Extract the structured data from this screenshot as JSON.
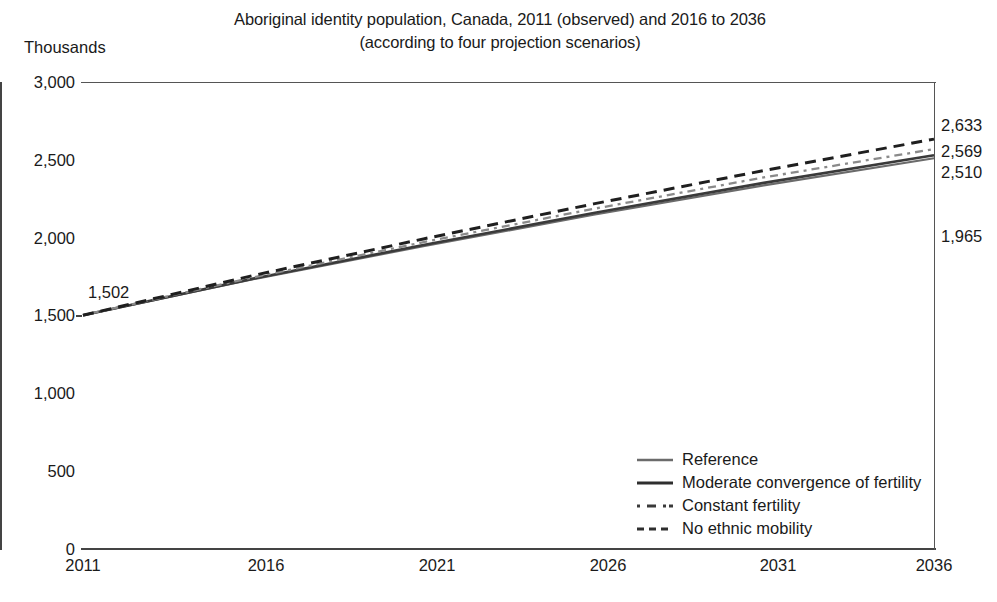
{
  "chart_data": {
    "type": "line",
    "title": "Aboriginal identity population, Canada, 2011 (observed) and 2016 to 2036",
    "subtitle": "(according to four projection scenarios)",
    "ylabel": "Thousands",
    "xlabel": "",
    "grid": false,
    "legend_position": "inside-bottom-right",
    "ylim": [
      0,
      3000
    ],
    "xlim": [
      2011,
      2036
    ],
    "yticks": [
      "0",
      "500",
      "1,000",
      "1,500",
      "2,000",
      "2,500",
      "3,000"
    ],
    "ytick_values": [
      0,
      500,
      1000,
      1500,
      2000,
      2500,
      3000
    ],
    "xticks": [
      "2011",
      "2016",
      "2021",
      "2026",
      "2031",
      "2036"
    ],
    "xtick_values": [
      2011,
      2016,
      2021,
      2026,
      2031,
      2036
    ],
    "x": [
      2011,
      2016,
      2021,
      2026,
      2031,
      2036
    ],
    "series": [
      {
        "name": "Reference",
        "style": "solid",
        "color": "#6b6b6b",
        "width": 2.1,
        "values": [
          1502,
          1733,
          1945,
          2147,
          2336,
          2510
        ]
      },
      {
        "name": "Moderate convergence of fertility",
        "style": "solid",
        "color": "#3a3a3a",
        "width": 2.6,
        "values": [
          1502,
          1737,
          1953,
          2158,
          2352,
          2530
        ]
      },
      {
        "name": "Constant fertility",
        "style": "dotted",
        "color": "#8a8a8a",
        "width": 2.3,
        "values": [
          1502,
          1745,
          1971,
          2185,
          2387,
          2569
        ]
      },
      {
        "name": "No ethnic mobility",
        "style": "dashed",
        "color": "#1f1f1f",
        "width": 3.0,
        "values": [
          1502,
          1757,
          1992,
          2217,
          2431,
          2633
        ]
      }
    ],
    "annotations": [
      {
        "text": "1,502",
        "x": 2011,
        "y": 1502,
        "position": "above-left"
      },
      {
        "text": "2,633",
        "x": 2036,
        "y": 2633,
        "position": "right"
      },
      {
        "text": "2,569",
        "x": 2036,
        "y": 2569,
        "position": "right"
      },
      {
        "text": "2,510",
        "x": 2036,
        "y": 2510,
        "position": "right"
      },
      {
        "text": "1,965",
        "x": 2036,
        "y": 1965,
        "position": "right"
      }
    ]
  },
  "title": {
    "line1": "Aboriginal identity population, Canada, 2011 (observed) and 2016 to 2036",
    "line2": "(according to four projection scenarios)"
  },
  "axes": {
    "unit_label": "Thousands",
    "y_ticks": [
      "3,000",
      "2,500",
      "2,000",
      "1,500",
      "1,000",
      "500",
      "0"
    ],
    "x_ticks": [
      "2011",
      "2016",
      "2021",
      "2026",
      "2031",
      "2036"
    ]
  },
  "labels": {
    "start": "1,502",
    "end_high": "2,633",
    "end_mid": "2,569",
    "end_low": "2,510",
    "end_mobility": "1,965"
  },
  "legend": {
    "items": [
      {
        "label": "Reference"
      },
      {
        "label": "Moderate convergence of fertility"
      },
      {
        "label": "Constant fertility"
      },
      {
        "label": "No ethnic mobility"
      }
    ]
  }
}
